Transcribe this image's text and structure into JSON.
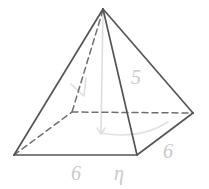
{
  "figure": {
    "background_color": "#ffffff",
    "solid_edge_color": "#555555",
    "hidden_edge_color": "#7a7a7a",
    "construction_line_color": "#d8d8d8",
    "label_color": "#c9c9c9"
  },
  "vertices": {
    "apex": {
      "name": "apex",
      "x": 103,
      "y": 9
    },
    "front_left": {
      "name": "front-left-base-corner",
      "x": 14,
      "y": 155
    },
    "front_bottom": {
      "name": "front-bottom-base-corner",
      "x": 137,
      "y": 155
    },
    "right": {
      "name": "right-base-corner",
      "x": 193,
      "y": 113
    },
    "back_hidden": {
      "name": "hidden-back-base-corner",
      "x": 72,
      "y": 112
    },
    "base_center": {
      "name": "base-center",
      "x": 103,
      "y": 133
    }
  },
  "edges": [
    {
      "name": "edge-apex-to-front-left",
      "style": "solid"
    },
    {
      "name": "edge-apex-to-front-bottom",
      "style": "solid"
    },
    {
      "name": "edge-apex-to-right",
      "style": "solid"
    },
    {
      "name": "edge-apex-to-back-hidden",
      "style": "dashed"
    },
    {
      "name": "edge-front-left-to-front-bottom",
      "style": "solid"
    },
    {
      "name": "edge-front-bottom-to-right",
      "style": "solid"
    },
    {
      "name": "edge-front-left-to-back-hidden",
      "style": "dashed"
    },
    {
      "name": "edge-back-hidden-to-right",
      "style": "dashed"
    }
  ],
  "construction_lines": [
    {
      "name": "height-line",
      "style": "faint",
      "from": "apex",
      "to": "base-center"
    },
    {
      "name": "slant-height-line",
      "style": "faint",
      "from": "base-center",
      "to": "front-bottom-right-edge-midpoint"
    },
    {
      "name": "angle-tick-mark",
      "style": "faint"
    }
  ],
  "labels": [
    {
      "name": "label-base-front-left",
      "text": "6",
      "x": 76,
      "y": 180,
      "rotate": 0
    },
    {
      "name": "label-base-front-right",
      "text": "η",
      "x": 119,
      "y": 180,
      "rotate": 0
    },
    {
      "name": "label-base-right-edge",
      "text": "6",
      "x": 168,
      "y": 158,
      "rotate": 0
    },
    {
      "name": "label-slant-height",
      "text": "5",
      "x": 136,
      "y": 84,
      "rotate": 0
    }
  ]
}
